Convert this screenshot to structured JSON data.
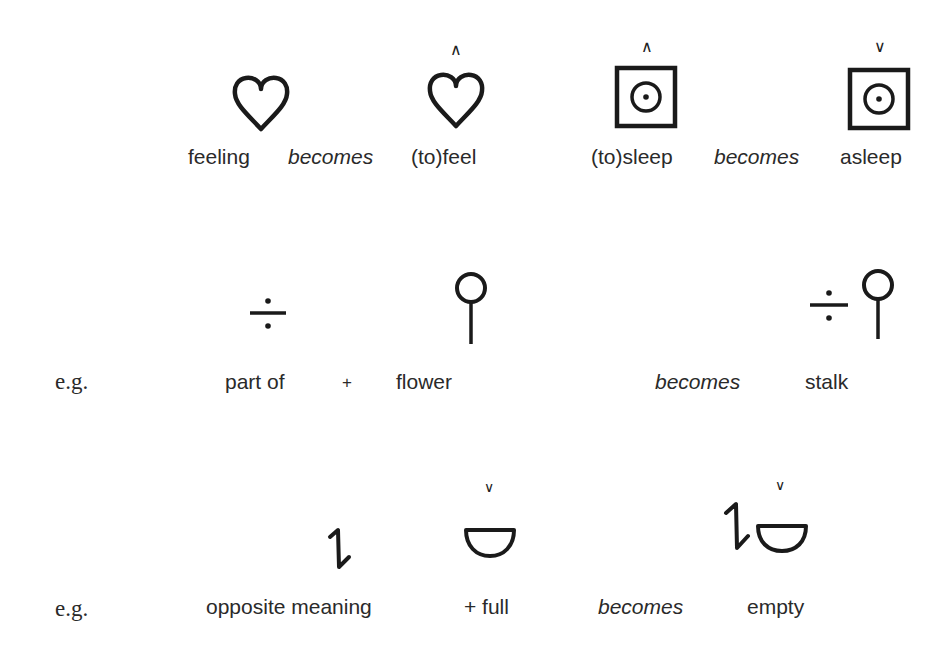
{
  "rows": [
    {
      "examples": [
        {
          "source_label": "feeling",
          "connector": "becomes",
          "result_label": "(to)feel",
          "source_symbol": "heart-icon",
          "result_symbol": "heart-icon",
          "result_indicator": "^"
        },
        {
          "source_label": "(to)sleep",
          "connector": "becomes",
          "result_label": "asleep",
          "source_symbol": "sleep-box-icon",
          "source_indicator": "^",
          "result_symbol": "sleep-box-icon",
          "result_indicator": "v"
        }
      ]
    },
    {
      "prefix": "e.g.",
      "part1_label": "part of",
      "plus": "+",
      "part2_label": "flower",
      "connector": "becomes",
      "result_label": "stalk",
      "part1_symbol": "division-sign-icon",
      "part2_symbol": "flower-icon",
      "result_symbol": "stalk-combined-icon"
    },
    {
      "prefix": "e.g.",
      "part1_label": "opposite meaning",
      "part2_label": "+ full",
      "connector": "becomes",
      "result_label": "empty",
      "part1_symbol": "opposite-zigzag-icon",
      "part2_symbol": "bowl-icon",
      "part2_indicator": "v",
      "result_symbol": "empty-combined-icon",
      "result_indicator": "v"
    }
  ],
  "colors": {
    "ink": "#1a1a1a",
    "text": "#2a2a2a",
    "background": "#ffffff"
  }
}
